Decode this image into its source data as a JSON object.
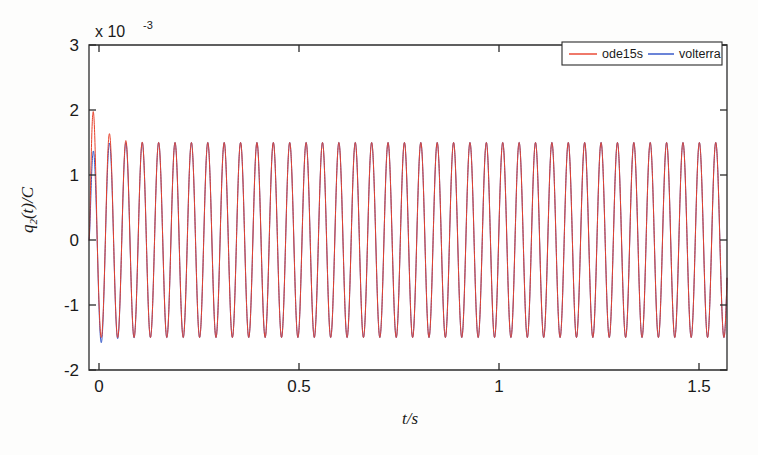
{
  "chart_data": {
    "type": "line",
    "title": "",
    "xlabel": "t/s",
    "ylabel": "q_2(t)/C",
    "ylabel_parts": {
      "base": "q",
      "subscript": "2",
      "arg": "(t)/C"
    },
    "y_exponent_prefix": "x 10",
    "y_exponent_value": "-3",
    "y_scale_note": "x 10^-3",
    "xlim": [
      0,
      1.57
    ],
    "ylim": [
      -2,
      3
    ],
    "x_ticks": [
      0,
      0.5,
      1,
      1.5
    ],
    "x_tick_labels": [
      "0",
      "0.5",
      "1",
      "1.5"
    ],
    "y_ticks": [
      -2,
      -1,
      0,
      1,
      2,
      3
    ],
    "y_tick_labels": [
      "-2",
      "-1",
      "0",
      "1",
      "2",
      "3"
    ],
    "grid": false,
    "legend_position": "top-right",
    "legend_orientation": "horizontal",
    "series": [
      {
        "name": "ode15s",
        "color": "#e8402a",
        "frequency_hz": 24.8,
        "steady_amplitude": 1.5,
        "initial_overshoot": 2.42,
        "decay_rate": 38,
        "phase": 0,
        "description": "Red curve: first peak overshoots to about 2.42e-3, second peak about 1.82e-3, third about 1.66e-3, then settles to a steady oscillation of about +/-1.5e-3"
      },
      {
        "name": "volterra",
        "color": "#2b50c8",
        "frequency_hz": 24.8,
        "steady_amplitude": 1.5,
        "initial_overshoot": 1.45,
        "initial_undershoot": -1.75,
        "decay_rate": 38,
        "phase": 0,
        "description": "Blue curve: first peak only about 1.45e-3 and first trough dips to about -1.75e-3, then converges to the same steady oscillation of about +/-1.5e-3"
      }
    ],
    "peak_values_ode15s": [
      2.42,
      1.82,
      1.66,
      1.58,
      1.54,
      1.52,
      1.51,
      1.5
    ],
    "peak_values_volterra": [
      1.45,
      1.5,
      1.5,
      1.5,
      1.5,
      1.5,
      1.5,
      1.5
    ],
    "trough_values_ode15s": [
      -1.5,
      -1.55,
      -1.52,
      -1.5,
      -1.5,
      -1.5,
      -1.5,
      -1.5
    ],
    "trough_values_volterra": [
      -1.75,
      -1.6,
      -1.55,
      -1.5,
      -1.5,
      -1.5,
      -1.5,
      -1.5
    ]
  },
  "legend": {
    "entries": [
      {
        "label": "ode15s",
        "color": "#e8402a"
      },
      {
        "label": "volterra",
        "color": "#2b50c8"
      }
    ]
  },
  "axes": {
    "x_title": "t/s",
    "y_title": "q2(t)/C",
    "exponent_text": "x 10",
    "exponent_power": "-3"
  }
}
